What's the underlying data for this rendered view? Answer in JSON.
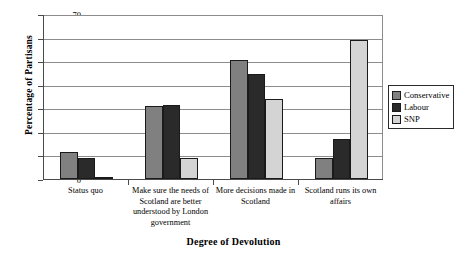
{
  "chart_data": {
    "type": "bar",
    "title": "",
    "xlabel": "Degree of Devolution",
    "ylabel": "Percentage of Partisans",
    "ylim": [
      0,
      70
    ],
    "ytick_step": 10,
    "yticks": [
      "70",
      "60",
      "50",
      "40",
      "30",
      "20",
      "10",
      "0"
    ],
    "grid": true,
    "legend_position": "right",
    "categories": [
      "Status quo",
      "Make sure the needs of Scotland are better understood by London government",
      "More decisions made in Scotland",
      "Scotland runs its own affairs"
    ],
    "category_lines": [
      [
        "Status quo"
      ],
      [
        "Make sure the needs of",
        "Scotland are better",
        "understood by London",
        "government"
      ],
      [
        "More decisions made in",
        "Scotland"
      ],
      [
        "Scotland runs its own",
        "affairs"
      ]
    ],
    "series": [
      {
        "name": "Conservative",
        "color": "#808080",
        "values": [
          11.5,
          31.0,
          50.5,
          9.0
        ]
      },
      {
        "name": "Labour",
        "color": "#2a2a2a",
        "values": [
          9.0,
          31.5,
          44.5,
          17.0
        ]
      },
      {
        "name": "SNP",
        "color": "#d4d4d4",
        "values": [
          0.5,
          9.0,
          34.0,
          59.0
        ]
      }
    ]
  },
  "legend": {
    "items": [
      {
        "label": "Conservative",
        "swatch": "legend-swatch-conservative"
      },
      {
        "label": "Labour",
        "swatch": "legend-swatch-labour"
      },
      {
        "label": "SNP",
        "swatch": "legend-swatch-snp"
      }
    ]
  }
}
